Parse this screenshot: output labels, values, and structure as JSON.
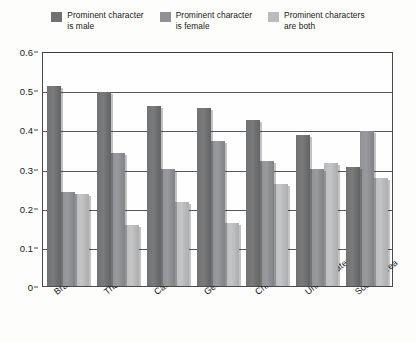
{
  "legend": {
    "items": [
      {
        "label": "Prominent character\nis male",
        "color": "#6f7173",
        "name": "legend-male"
      },
      {
        "label": "Prominent character\nis female",
        "color": "#8e9093",
        "name": "legend-female"
      },
      {
        "label": "Prominent characters\nare both",
        "color": "#b9bbbd",
        "name": "legend-both"
      }
    ]
  },
  "axes": {
    "y_ticks": [
      "0.6",
      "0.5",
      "0.4",
      "0.3",
      "0.2",
      "0.1",
      "0"
    ],
    "y_min": 0,
    "y_max": 0.6
  },
  "chart_data": {
    "type": "bar",
    "title": "",
    "xlabel": "",
    "ylabel": "",
    "ylim": [
      0,
      0.6
    ],
    "grid": true,
    "legend_position": "top",
    "categories": [
      "Brazil",
      "Thailand",
      "Canada",
      "Germany",
      "China",
      "United States",
      "South Korea"
    ],
    "series": [
      {
        "name": "Prominent character is male",
        "color": "#6f7173",
        "values": [
          0.51,
          0.495,
          0.46,
          0.455,
          0.425,
          0.385,
          0.305
        ]
      },
      {
        "name": "Prominent character is female",
        "color": "#8e9093",
        "values": [
          0.24,
          0.34,
          0.3,
          0.37,
          0.32,
          0.3,
          0.395
        ]
      },
      {
        "name": "Prominent characters are both",
        "color": "#b9bbbd",
        "values": [
          0.235,
          0.155,
          0.215,
          0.16,
          0.26,
          0.315,
          0.275
        ]
      }
    ]
  }
}
